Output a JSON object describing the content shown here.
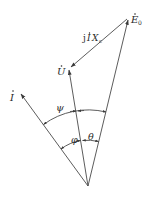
{
  "diagram": {
    "type": "phasor-diagram",
    "colors": {
      "line": "#4a4a4a",
      "text": "#2a2a2a",
      "background": "#ffffff"
    },
    "origin": {
      "x": 88,
      "y": 186
    },
    "phasors": [
      {
        "id": "E0",
        "label": "E",
        "sub": "0",
        "dot": true,
        "tip": {
          "x": 128,
          "y": 18
        }
      },
      {
        "id": "U",
        "label": "U",
        "dot": true,
        "tip": {
          "x": 69,
          "y": 68
        }
      },
      {
        "id": "I",
        "label": "I",
        "dot": true,
        "tip": {
          "x": 20,
          "y": 93
        }
      }
    ],
    "voltage_drop": {
      "label_prefix": "j",
      "label_I": "I",
      "label_X": "X",
      "label_sub": "c",
      "from": "E0",
      "to": "U"
    },
    "angles": [
      {
        "id": "psi",
        "symbol": "ψ",
        "between": [
          "I",
          "E0"
        ]
      },
      {
        "id": "phi",
        "symbol": "φ",
        "between": [
          "I",
          "U"
        ]
      },
      {
        "id": "theta",
        "symbol": "θ",
        "between": [
          "U",
          "E0"
        ]
      }
    ]
  }
}
